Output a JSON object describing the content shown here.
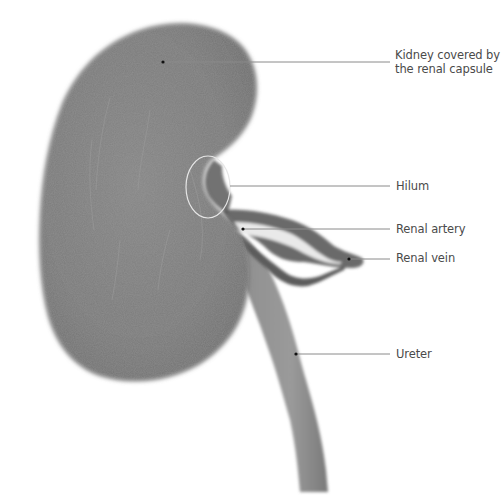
{
  "figure": {
    "type": "anatomical-illustration",
    "subject": "Kidney",
    "colors": {
      "background": "#ffffff",
      "tissue": "#7b7b7b",
      "tissue_dark": "#5e5e5e",
      "tissue_light": "#a3a3a3",
      "leader_line": "#8a8a8a",
      "label_text": "#4a4a4a",
      "hilum_outline": "#e6e6e6"
    }
  },
  "labels": [
    {
      "id": "kidney",
      "line1": "Kidney covered by",
      "line2": "the renal capsule",
      "point": [
        163,
        62
      ],
      "line_end_x": 390,
      "line_y": 62
    },
    {
      "id": "hilum",
      "line1": "Hilum",
      "point": [
        230,
        186
      ],
      "line_end_x": 390,
      "line_y": 186
    },
    {
      "id": "renal_artery",
      "line1": "Renal artery",
      "point": [
        243,
        229
      ],
      "line_end_x": 390,
      "line_y": 229
    },
    {
      "id": "renal_vein",
      "line1": "Renal vein",
      "point": [
        349,
        259
      ],
      "line_end_x": 390,
      "line_y": 259
    },
    {
      "id": "ureter",
      "line1": "Ureter",
      "point": [
        296,
        354
      ],
      "line_end_x": 390,
      "line_y": 354
    }
  ]
}
